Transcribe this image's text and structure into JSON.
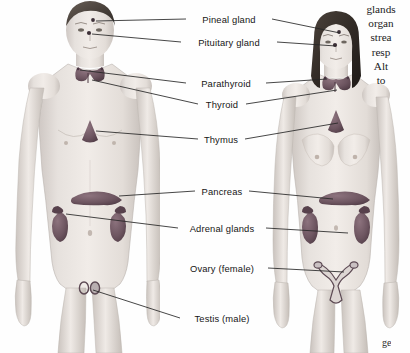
{
  "figure": {
    "type": "anatomical-illustration",
    "background_color": "#fefefe",
    "line_color": "#262626",
    "label_color": "#161616",
    "organ_color": "#6d5560",
    "skin_color": "#e8e3e0"
  },
  "subjects": [
    {
      "id": "male-figure",
      "name": "Male body (anterior view)",
      "side": "left"
    },
    {
      "id": "female-figure",
      "name": "Female body (anterior view)",
      "side": "right"
    }
  ],
  "labels": [
    {
      "id": "pineal-gland",
      "text": "Pineal gland",
      "x": 229,
      "y": 19,
      "both": true
    },
    {
      "id": "pituitary-gland",
      "text": "Pituitary gland",
      "x": 229,
      "y": 42,
      "both": true
    },
    {
      "id": "parathyroid",
      "text": "Parathyroid",
      "x": 226,
      "y": 83,
      "both": true
    },
    {
      "id": "thyroid",
      "text": "Thyroid",
      "x": 222,
      "y": 104,
      "both": true
    },
    {
      "id": "thymus",
      "text": "Thymus",
      "x": 221,
      "y": 139,
      "both": true
    },
    {
      "id": "pancreas",
      "text": "Pancreas",
      "x": 222,
      "y": 191,
      "both": true
    },
    {
      "id": "adrenal-glands",
      "text": "Adrenal glands",
      "x": 222,
      "y": 228,
      "both": true
    },
    {
      "id": "ovary-female",
      "text": "Ovary (female)",
      "x": 222,
      "y": 268,
      "both": false,
      "only": "right"
    },
    {
      "id": "testis-male",
      "text": "Testis (male)",
      "x": 222,
      "y": 318,
      "both": false,
      "only": "left"
    }
  ],
  "body_copy": {
    "lines": [
      "glands",
      "organ",
      "strea",
      "resp",
      "Alt",
      "to"
    ],
    "note_clipped": true
  },
  "corner_copy": {
    "text": "ge"
  }
}
